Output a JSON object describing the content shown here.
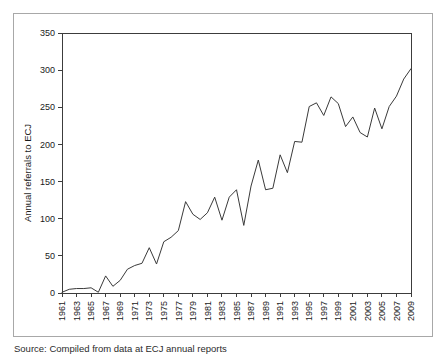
{
  "figure": {
    "caption": "Source:  Compiled from data at ECJ annual reports"
  },
  "chart_data": {
    "type": "line",
    "title": "",
    "xlabel": "",
    "ylabel": "Annual referrals to ECJ",
    "ylim": [
      0,
      350
    ],
    "yticks": [
      0,
      50,
      100,
      150,
      200,
      250,
      300,
      350
    ],
    "xlim": [
      1961,
      2009
    ],
    "xticks": [
      1961,
      1963,
      1965,
      1967,
      1969,
      1971,
      1973,
      1975,
      1977,
      1979,
      1981,
      1983,
      1985,
      1987,
      1989,
      1991,
      1993,
      1995,
      1997,
      1999,
      2001,
      2003,
      2005,
      2007,
      2009
    ],
    "grid": false,
    "legend": false,
    "line_color": "#3a3a3a",
    "series": [
      {
        "name": "Annual referrals to ECJ",
        "x": [
          1961,
          1962,
          1963,
          1964,
          1965,
          1966,
          1967,
          1968,
          1969,
          1970,
          1971,
          1972,
          1973,
          1974,
          1975,
          1976,
          1977,
          1978,
          1979,
          1980,
          1981,
          1982,
          1983,
          1984,
          1985,
          1986,
          1987,
          1988,
          1989,
          1990,
          1991,
          1992,
          1993,
          1994,
          1995,
          1996,
          1997,
          1998,
          1999,
          2000,
          2001,
          2002,
          2003,
          2004,
          2005,
          2006,
          2007,
          2008,
          2009
        ],
        "values": [
          1,
          5,
          6,
          6,
          7,
          1,
          23,
          9,
          17,
          32,
          37,
          40,
          61,
          39,
          69,
          75,
          84,
          123,
          106,
          99,
          108,
          129,
          98,
          129,
          139,
          91,
          144,
          179,
          139,
          141,
          186,
          162,
          204,
          203,
          251,
          256,
          239,
          264,
          255,
          224,
          237,
          216,
          210,
          249,
          221,
          251,
          265,
          288,
          302
        ]
      }
    ]
  }
}
